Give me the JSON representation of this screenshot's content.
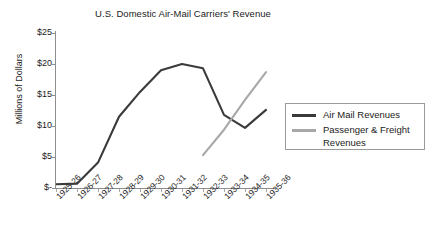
{
  "chart_data": {
    "type": "line",
    "title": "U.S. Domestic Air-Mail Carriers' Revenue",
    "xlabel": "",
    "ylabel": "Millions of Dollars",
    "categories": [
      "1925-26",
      "1926-27",
      "1927-28",
      "1928-29",
      "1929-30",
      "1930-31",
      "1931-32",
      "1932-33",
      "1933-34",
      "1934-35",
      "1935-36"
    ],
    "ytick_labels": [
      "$25",
      "$20",
      "$15",
      "$10",
      "$5",
      "$-"
    ],
    "ytick_values": [
      25,
      20,
      15,
      10,
      5,
      0
    ],
    "ylim": [
      0,
      25
    ],
    "grid": false,
    "legend_position": "right",
    "series": [
      {
        "name": "Air Mail Revenues",
        "color": "#3a3a3a",
        "values": [
          0.6,
          0.7,
          4.1,
          11.5,
          15.5,
          19.0,
          20.0,
          19.3,
          11.8,
          9.7,
          12.6
        ]
      },
      {
        "name": "Passenger & Freight Revenues",
        "color": "#a8a8a8",
        "values": [
          null,
          null,
          null,
          null,
          null,
          null,
          null,
          5.3,
          9.4,
          14.2,
          18.7
        ]
      }
    ]
  },
  "legend": {
    "entries": [
      {
        "label": "Air Mail Revenues"
      },
      {
        "label": "Passenger & Freight Revenues"
      }
    ]
  }
}
